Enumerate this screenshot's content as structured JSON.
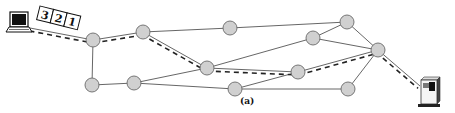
{
  "caption": "(a)",
  "colors": {
    "node_fill": "#d0d0d0",
    "node_stroke": "#6a6a6a",
    "link": "#555555",
    "path_dash": "#222222",
    "background": "#ffffff"
  },
  "source": {
    "name": "laptop",
    "icon": "laptop-icon",
    "x": 18,
    "y": 25
  },
  "destination": {
    "name": "server",
    "icon": "server-icon",
    "x": 430,
    "y": 95
  },
  "packets": [
    {
      "label": "3"
    },
    {
      "label": "2"
    },
    {
      "label": "1"
    }
  ],
  "nodes": [
    {
      "id": "A",
      "x": 93,
      "y": 40
    },
    {
      "id": "B",
      "x": 143,
      "y": 32
    },
    {
      "id": "C",
      "x": 230,
      "y": 28
    },
    {
      "id": "D",
      "x": 347,
      "y": 22
    },
    {
      "id": "E",
      "x": 313,
      "y": 38
    },
    {
      "id": "F",
      "x": 378,
      "y": 50
    },
    {
      "id": "G",
      "x": 207,
      "y": 68
    },
    {
      "id": "H",
      "x": 298,
      "y": 72
    },
    {
      "id": "I",
      "x": 92,
      "y": 85
    },
    {
      "id": "J",
      "x": 134,
      "y": 83
    },
    {
      "id": "K",
      "x": 235,
      "y": 89
    },
    {
      "id": "L",
      "x": 348,
      "y": 89
    }
  ],
  "links": [
    [
      "src",
      "A"
    ],
    [
      "A",
      "B"
    ],
    [
      "A",
      "I"
    ],
    [
      "B",
      "C"
    ],
    [
      "B",
      "G"
    ],
    [
      "C",
      "D"
    ],
    [
      "D",
      "F"
    ],
    [
      "D",
      "E"
    ],
    [
      "E",
      "F"
    ],
    [
      "E",
      "G"
    ],
    [
      "G",
      "H"
    ],
    [
      "G",
      "J"
    ],
    [
      "I",
      "J"
    ],
    [
      "J",
      "K"
    ],
    [
      "K",
      "L"
    ],
    [
      "K",
      "H"
    ],
    [
      "H",
      "F"
    ],
    [
      "L",
      "F"
    ],
    [
      "F",
      "dst"
    ]
  ],
  "dashed_path": [
    "src",
    "A",
    "B",
    "G",
    "H",
    "F",
    "dst"
  ]
}
